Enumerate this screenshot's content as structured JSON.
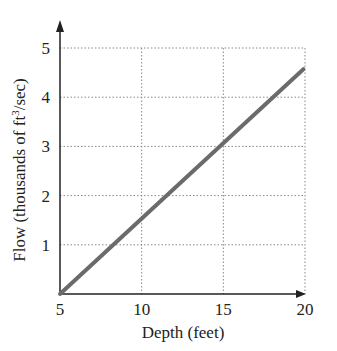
{
  "chart_data": {
    "type": "line",
    "title": "",
    "xlabel": "Depth (feet)",
    "ylabel": "Flow (thousands of ft³/sec)",
    "ylabel_parts": {
      "pre": "Flow (thousands of ft",
      "sup": "3",
      "post": "/sec)"
    },
    "x_ticks": [
      "5",
      "10",
      "15",
      "20"
    ],
    "y_ticks": [
      "1",
      "2",
      "3",
      "4",
      "5"
    ],
    "xlim": [
      5,
      21
    ],
    "ylim": [
      0,
      5.4
    ],
    "grid": true,
    "grid_style": "dotted",
    "legend": null,
    "series": [
      {
        "name": "Flow",
        "color": "#6b6b6b",
        "x": [
          5,
          19.9
        ],
        "y": [
          0,
          4.57
        ]
      }
    ]
  }
}
